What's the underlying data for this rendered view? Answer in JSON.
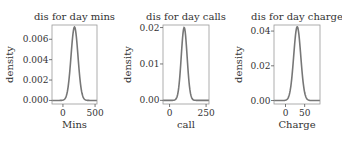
{
  "figure": {
    "background": "#ffffff",
    "line_color": "#777777",
    "axis_color": "#555555",
    "text_color": "#333333"
  },
  "chart_data": [
    {
      "type": "line",
      "title": "dis for day mins",
      "xlabel": "Mins",
      "ylabel": "density",
      "xlim": [
        -170,
        530
      ],
      "ylim": [
        -0.00035,
        0.0074
      ],
      "xticks": [
        0,
        500
      ],
      "xtick_labels": [
        "0",
        "500"
      ],
      "yticks": [
        0.0,
        0.002,
        0.004,
        0.006
      ],
      "ytick_labels": [
        "0.000",
        "0.002",
        "0.004",
        "0.006"
      ],
      "distribution": {
        "mean": 180,
        "sd": 54,
        "peak": 0.0072
      },
      "box": {
        "x": 52,
        "y": 25,
        "w": 45,
        "h": 79
      }
    },
    {
      "type": "line",
      "title": "dis for day calls",
      "xlabel": "call",
      "ylabel": "density",
      "xlim": [
        -45,
        270
      ],
      "ylim": [
        -0.001,
        0.0207
      ],
      "xticks": [
        0,
        250
      ],
      "xtick_labels": [
        "0",
        "250"
      ],
      "yticks": [
        0.0,
        0.01,
        0.02
      ],
      "ytick_labels": [
        "0.00",
        "0.01",
        "0.02"
      ],
      "distribution": {
        "mean": 100,
        "sd": 20,
        "peak": 0.02
      },
      "box": {
        "x": 163,
        "y": 25,
        "w": 46,
        "h": 79
      }
    },
    {
      "type": "line",
      "title": "dis for day charge",
      "xlabel": "Charge",
      "ylabel": "density",
      "xlim": [
        -30,
        90
      ],
      "ylim": [
        -0.002,
        0.0435
      ],
      "xticks": [
        0,
        50
      ],
      "xtick_labels": [
        "0",
        "50"
      ],
      "yticks": [
        0.0,
        0.02,
        0.04
      ],
      "ytick_labels": [
        "0.00",
        "0.02",
        "0.04"
      ],
      "distribution": {
        "mean": 30.6,
        "sd": 9.2,
        "peak": 0.0425
      },
      "box": {
        "x": 274,
        "y": 25,
        "w": 46,
        "h": 79
      }
    }
  ]
}
